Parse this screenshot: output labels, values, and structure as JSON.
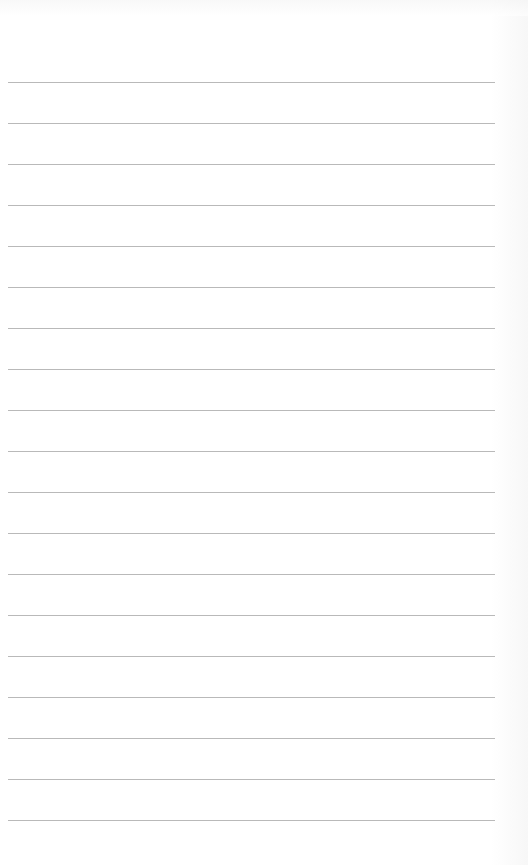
{
  "page": {
    "type": "lined-paper",
    "background_color": "#ffffff",
    "line_color": "#b9b9b9",
    "line_count": 19,
    "first_line_y": 82,
    "line_spacing_px": 41,
    "line_left_x": 8,
    "line_right_x": 495
  }
}
